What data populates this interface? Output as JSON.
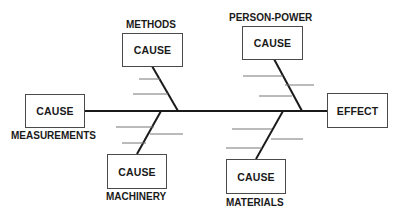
{
  "diagram": {
    "type": "fishbone",
    "effect": {
      "label": "EFFECT"
    },
    "causes": [
      {
        "category": "METHODS",
        "box_label": "CAUSE",
        "position": "top-left"
      },
      {
        "category": "PERSON-POWER",
        "box_label": "CAUSE",
        "position": "top-right"
      },
      {
        "category": "MEASUREMENTS",
        "box_label": "CAUSE",
        "position": "left"
      },
      {
        "category": "MACHINERY",
        "box_label": "CAUSE",
        "position": "bottom-left"
      },
      {
        "category": "MATERIALS",
        "box_label": "CAUSE",
        "position": "bottom-right"
      }
    ],
    "line_color": "#1a1a1a",
    "sub_cause_line_color": "#777777"
  }
}
